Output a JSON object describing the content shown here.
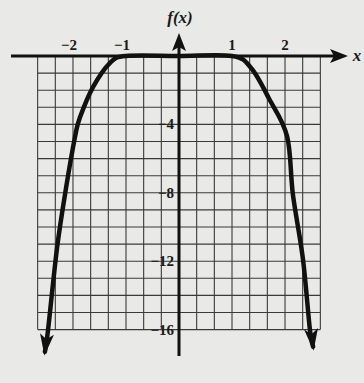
{
  "chart_data": {
    "type": "line",
    "title": "",
    "xlabel": "x",
    "ylabel": "f(x)",
    "xlim": [
      -2.667,
      2.667
    ],
    "ylim": [
      -16,
      0
    ],
    "grid": true,
    "grid_x_step": 0.3333,
    "grid_y_step": 1,
    "x_ticks": [
      {
        "value": -2,
        "label": "−2"
      },
      {
        "value": -1,
        "label": "−1"
      },
      {
        "value": 1,
        "label": "1"
      },
      {
        "value": 2,
        "label": "2"
      }
    ],
    "y_ticks": [
      {
        "value": -4,
        "label": "−4"
      },
      {
        "value": -8,
        "label": "−8"
      },
      {
        "value": -12,
        "label": "−12"
      },
      {
        "value": -16,
        "label": "−16"
      }
    ],
    "series": [
      {
        "name": "f(x)",
        "arrows_at_ends": true,
        "x": [
          -2.53,
          -2.47,
          -2.3,
          -2.13,
          -1.96,
          -1.87,
          -1.62,
          -1.3,
          -1.0,
          0.0,
          1.0,
          1.36,
          1.7,
          2.04,
          2.15,
          2.34,
          2.47,
          2.53
        ],
        "y": [
          -17.3,
          -16.0,
          -11.2,
          -7.7,
          -4.7,
          -3.6,
          -1.8,
          -0.4,
          0.0,
          0.0,
          0.0,
          -0.7,
          -2.5,
          -4.7,
          -8.1,
          -11.9,
          -16.0,
          -17.0
        ]
      }
    ],
    "color": "#111111"
  }
}
